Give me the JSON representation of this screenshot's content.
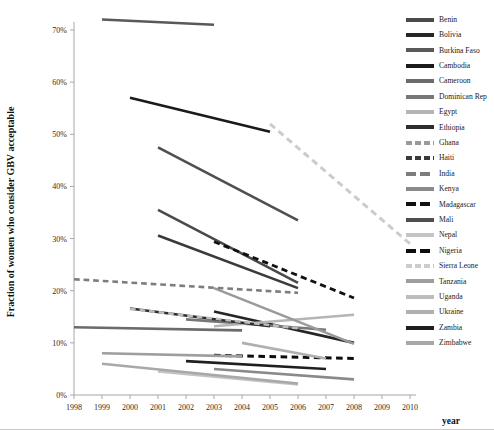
{
  "chart_data": {
    "type": "line",
    "title": "",
    "xlabel": "year",
    "ylabel": "Fraction of women who consider GBV acceptable",
    "xlim": [
      1998,
      2010
    ],
    "ylim": [
      0,
      0.75
    ],
    "xticks": [
      1998,
      1999,
      2000,
      2001,
      2002,
      2003,
      2004,
      2005,
      2006,
      2007,
      2008,
      2009,
      2010
    ],
    "yticks": [
      0,
      10,
      20,
      30,
      40,
      50,
      60,
      70
    ],
    "ytick_labels": [
      "0%",
      "10%",
      "20%",
      "30%",
      "40%",
      "50%",
      "60%",
      "70%"
    ],
    "grid": false,
    "legend_position": "right",
    "series": [
      {
        "name": "Benin",
        "color": "#4a4a4a",
        "dash": "solid",
        "width": 2.6,
        "x": [
          2001,
          2006
        ],
        "values": [
          35.5,
          21.5
        ]
      },
      {
        "name": "Bolivia",
        "color": "#262626",
        "dash": "solid",
        "width": 2.6,
        "x": [
          2003,
          2008
        ],
        "values": [
          16.0,
          10.0
        ]
      },
      {
        "name": "Burkina Faso",
        "color": "#595959",
        "dash": "solid",
        "width": 2.6,
        "x": [
          1999,
          2003
        ],
        "values": [
          72.0,
          71.0
        ]
      },
      {
        "name": "Cambodia",
        "color": "#1a1a1a",
        "dash": "solid",
        "width": 2.6,
        "x": [
          2000,
          2005
        ],
        "values": [
          57.0,
          50.5
        ]
      },
      {
        "name": "Cameroon",
        "color": "#6b6b6b",
        "dash": "solid",
        "width": 2.6,
        "x": [
          1998,
          2004
        ],
        "values": [
          13.0,
          12.4
        ]
      },
      {
        "name": "Dominican Rep",
        "color": "#787878",
        "dash": "solid",
        "width": 2.6,
        "x": [
          2002,
          2007
        ],
        "values": [
          14.5,
          12.5
        ]
      },
      {
        "name": "Egypt",
        "color": "#b5b5b5",
        "dash": "solid",
        "width": 2.6,
        "x": [
          2003,
          2008
        ],
        "values": [
          13.2,
          15.4
        ]
      },
      {
        "name": "Ethiopia",
        "color": "#2e2e2e",
        "dash": "solid",
        "width": 2.6,
        "x": [
          2000,
          2005
        ],
        "values": [
          16.6,
          13.2
        ]
      },
      {
        "name": "Ghana",
        "color": "#9a9a9a",
        "dash": "solid",
        "width": 2.6,
        "x": [
          2003,
          2008
        ],
        "values": [
          20.5,
          9.8
        ]
      },
      {
        "name": "Haiti",
        "color": "#3a3a3a",
        "dash": "solid",
        "width": 2.6,
        "x": [
          2001,
          2006
        ],
        "values": [
          30.6,
          20.5
        ]
      },
      {
        "name": "India",
        "color": "#7d7d7d",
        "dash": "dashed",
        "width": 2.6,
        "x": [
          1998,
          2006
        ],
        "values": [
          22.2,
          19.6
        ]
      },
      {
        "name": "Kenya",
        "color": "#8a8a8a",
        "dash": "solid",
        "width": 2.6,
        "x": [
          2003,
          2008
        ],
        "values": [
          5.0,
          3.0
        ]
      },
      {
        "name": "Madagascar",
        "color": "#111111",
        "dash": "dashed",
        "width": 2.8,
        "x": [
          2003,
          2008
        ],
        "values": [
          29.4,
          18.6
        ]
      },
      {
        "name": "Mali",
        "color": "#4f4f4f",
        "dash": "solid",
        "width": 2.6,
        "x": [
          2001,
          2006
        ],
        "values": [
          47.5,
          33.5
        ]
      },
      {
        "name": "Nepal",
        "color": "#c4c4c4",
        "dash": "solid",
        "width": 2.6,
        "x": [
          2001,
          2006
        ],
        "values": [
          4.5,
          2.0
        ]
      },
      {
        "name": "Nigeria",
        "color": "#0d0d0d",
        "dash": "dashed",
        "width": 3.0,
        "x": [
          2003,
          2008
        ],
        "values": [
          7.6,
          7.0
        ]
      },
      {
        "name": "Sierra Leone",
        "color": "#cccccc",
        "dash": "dashed",
        "width": 3.0,
        "x": [
          2005,
          2010
        ],
        "values": [
          52.0,
          29.0
        ]
      },
      {
        "name": "Tanzania",
        "color": "#9e9e9e",
        "dash": "solid",
        "width": 2.6,
        "x": [
          1999,
          2004
        ],
        "values": [
          8.0,
          7.4
        ]
      },
      {
        "name": "Uganda",
        "color": "#bdbdbd",
        "dash": "dashed",
        "width": 2.6,
        "x": [
          2000,
          2006
        ],
        "values": [
          16.5,
          12.8
        ]
      },
      {
        "name": "Ukraine",
        "color": "#b0b0b0",
        "dash": "solid",
        "width": 2.6,
        "x": [
          2004,
          2007
        ],
        "values": [
          10.0,
          7.0
        ]
      },
      {
        "name": "Zambia",
        "color": "#1f1f1f",
        "dash": "solid",
        "width": 2.6,
        "x": [
          2002,
          2007
        ],
        "values": [
          6.5,
          5.0
        ]
      },
      {
        "name": "Zimbabwe",
        "color": "#a8a8a8",
        "dash": "solid",
        "width": 2.6,
        "x": [
          1999,
          2006
        ],
        "values": [
          6.0,
          2.2
        ]
      }
    ]
  },
  "axes": {
    "x_title": "year",
    "y_title": "Fraction of women who consider GBV acceptable"
  },
  "legend": {
    "items": [
      {
        "label": "Benin",
        "color": "#4a4a4a",
        "dash": "solid"
      },
      {
        "label": "Bolivia",
        "color": "#262626",
        "dash": "solid"
      },
      {
        "label": "Burkina Faso",
        "color": "#595959",
        "dash": "solid"
      },
      {
        "label": "Cambodia",
        "color": "#1a1a1a",
        "dash": "solid"
      },
      {
        "label": "Cameroon",
        "color": "#6b6b6b",
        "dash": "solid"
      },
      {
        "label": "Dominican Rep",
        "color": "#787878",
        "dash": "solid"
      },
      {
        "label": "Egypt",
        "color": "#b5b5b5",
        "dash": "solid"
      },
      {
        "label": "Ethiopia",
        "color": "#2e2e2e",
        "dash": "solid"
      },
      {
        "label": "Ghana",
        "color": "#9a9a9a",
        "dash": "short"
      },
      {
        "label": "Haiti",
        "color": "#3a3a3a",
        "dash": "short"
      },
      {
        "label": "India",
        "color": "#7d7d7d",
        "dash": "dashed"
      },
      {
        "label": "Kenya",
        "color": "#8a8a8a",
        "dash": "solid"
      },
      {
        "label": "Madagascar",
        "color": "#111111",
        "dash": "dashed"
      },
      {
        "label": "Mali",
        "color": "#4f4f4f",
        "dash": "solid"
      },
      {
        "label": "Nepal",
        "color": "#c4c4c4",
        "dash": "solid"
      },
      {
        "label": "Nigeria",
        "color": "#0d0d0d",
        "dash": "dashed"
      },
      {
        "label": "Sierra Leone",
        "color": "#cccccc",
        "dash": "short"
      },
      {
        "label": "Tanzania",
        "color": "#9e9e9e",
        "dash": "solid"
      },
      {
        "label": "Uganda",
        "color": "#bdbdbd",
        "dash": "solid"
      },
      {
        "label": "Ukraine",
        "color": "#b0b0b0",
        "dash": "solid"
      },
      {
        "label": "Zambia",
        "color": "#1f1f1f",
        "dash": "solid"
      },
      {
        "label": "Zimbabwe",
        "color": "#a8a8a8",
        "dash": "solid"
      }
    ]
  }
}
